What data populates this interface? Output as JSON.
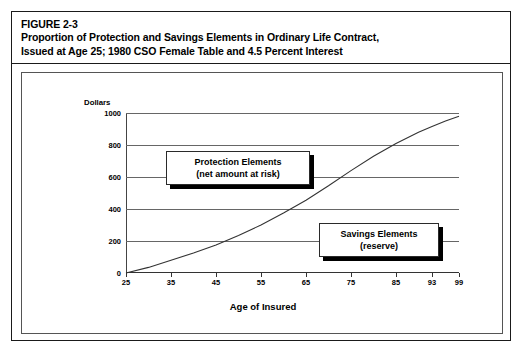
{
  "figure": {
    "number_label": "FIGURE 2-3",
    "title_line_1": "Proportion of Protection and Savings Elements in Ordinary Life Contract,",
    "title_line_2": "Issued at Age 25; 1980 CSO Female Table and 4.5 Percent Interest"
  },
  "annotations": {
    "protection": {
      "line_1": "Protection Elements",
      "line_2": "(net amount at risk)"
    },
    "savings": {
      "line_1": "Savings Elements",
      "line_2": "(reserve)"
    }
  },
  "chart_data": {
    "type": "line",
    "title": "Proportion of Protection and Savings Elements in Ordinary Life Contract, Issued at Age 25; 1980 CSO Female Table and 4.5 Percent Interest",
    "xlabel": "Age of Insured",
    "ylabel": "Dollars",
    "xlim": [
      25,
      99
    ],
    "ylim": [
      0,
      1000
    ],
    "grid": true,
    "legend_position": "none",
    "x_tick_labels": [
      "25",
      "35",
      "45",
      "55",
      "65",
      "75",
      "85",
      "93",
      "99"
    ],
    "x_ticks": [
      25,
      35,
      45,
      55,
      65,
      75,
      85,
      93,
      99
    ],
    "y_tick_labels": [
      "0",
      "200",
      "400",
      "600",
      "800",
      "1000"
    ],
    "y_ticks": [
      0,
      200,
      400,
      600,
      800,
      1000
    ],
    "series": [
      {
        "name": "Reserve (savings element)",
        "x": [
          25,
          30,
          35,
          40,
          45,
          50,
          55,
          60,
          65,
          70,
          75,
          80,
          85,
          90,
          93,
          96,
          99
        ],
        "values": [
          0,
          35,
          80,
          125,
          175,
          235,
          300,
          375,
          455,
          545,
          640,
          730,
          810,
          880,
          915,
          950,
          980
        ]
      }
    ],
    "annotations": [
      {
        "text": "Protection Elements (net amount at risk)",
        "region": "area above the curve",
        "x": 42,
        "y": 790
      },
      {
        "text": "Savings Elements (reserve)",
        "region": "area below the curve",
        "x": 77,
        "y": 360
      }
    ]
  }
}
